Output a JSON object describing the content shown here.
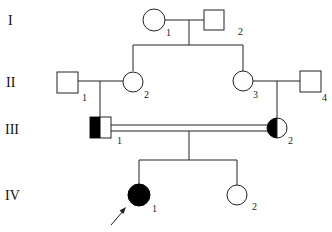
{
  "diagram": {
    "type": "pedigree",
    "generations": [
      {
        "label": "I",
        "y": 20
      },
      {
        "label": "II",
        "y": 82
      },
      {
        "label": "III",
        "y": 129
      },
      {
        "label": "IV",
        "y": 195
      }
    ],
    "individuals": [
      {
        "id": "I-1",
        "number": "1",
        "sex": "female",
        "status": "unaffected"
      },
      {
        "id": "I-2",
        "number": "2",
        "sex": "male",
        "status": "unaffected"
      },
      {
        "id": "II-1",
        "number": "1",
        "sex": "male",
        "status": "unaffected"
      },
      {
        "id": "II-2",
        "number": "2",
        "sex": "female",
        "status": "unaffected"
      },
      {
        "id": "II-3",
        "number": "3",
        "sex": "female",
        "status": "unaffected"
      },
      {
        "id": "II-4",
        "number": "4",
        "sex": "male",
        "status": "unaffected"
      },
      {
        "id": "III-1",
        "number": "1",
        "sex": "male",
        "status": "carrier (half-filled)"
      },
      {
        "id": "III-2",
        "number": "2",
        "sex": "female",
        "status": "carrier (half-filled)"
      },
      {
        "id": "IV-1",
        "number": "1",
        "sex": "female",
        "status": "affected",
        "proband": true
      },
      {
        "id": "IV-2",
        "number": "2",
        "sex": "female",
        "status": "unaffected"
      }
    ],
    "relationships": [
      {
        "type": "mating",
        "partners": [
          "I-1",
          "I-2"
        ],
        "children": [
          "II-2",
          "II-3"
        ]
      },
      {
        "type": "mating",
        "partners": [
          "II-1",
          "II-2"
        ],
        "children": [
          "III-1"
        ]
      },
      {
        "type": "mating",
        "partners": [
          "II-3",
          "II-4"
        ],
        "children": [
          "III-2"
        ]
      },
      {
        "type": "consanguineous mating",
        "partners": [
          "III-1",
          "III-2"
        ],
        "children": [
          "IV-1",
          "IV-2"
        ]
      }
    ],
    "colors": {
      "line": "#222222",
      "fill_affected": "#000000",
      "fill_unaffected": "#ffffff"
    }
  }
}
